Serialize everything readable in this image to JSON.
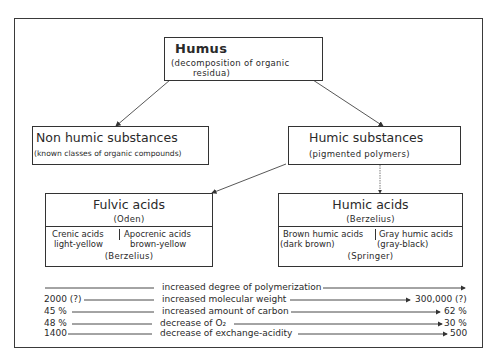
{
  "diagram": {
    "root": {
      "title": "Humus",
      "subtitle_line1": "(decomposition of organic",
      "subtitle_line2": "residua)"
    },
    "non_humic": {
      "title": "Non humic substances",
      "subtitle": "(known classes of organic compounds)"
    },
    "humic_substances": {
      "title": "Humic substances",
      "subtitle": "(pigmented polymers)"
    },
    "fulvic_acids": {
      "title": "Fulvic acids",
      "author": "(Oden)",
      "left_name": "Crenic acids",
      "left_color": "light-yellow",
      "right_name": "Apocrenic acids",
      "right_color": "brown-yellow",
      "footer": "(Berzelius)"
    },
    "humic_acids": {
      "title": "Humic acids",
      "author": "(Berzelius)",
      "left_name": "Brown humic acids",
      "left_color": "(dark brown)",
      "right_name": "Gray humic acids",
      "right_color": "(gray-black)",
      "footer": "(Springer)"
    },
    "trends": [
      {
        "left": "",
        "label": "increased degree of polymerization",
        "right": ""
      },
      {
        "left": "2000 (?)",
        "label": "increased molecular weight",
        "right": "300,000 (?)"
      },
      {
        "left": "45 %",
        "label": "increased amount of carbon",
        "right": "62 %"
      },
      {
        "left": "48 %",
        "label": "decrease of O₂",
        "right": "30 %"
      },
      {
        "left": "1400",
        "label": "decrease of exchange-acidity",
        "right": "500"
      }
    ]
  }
}
